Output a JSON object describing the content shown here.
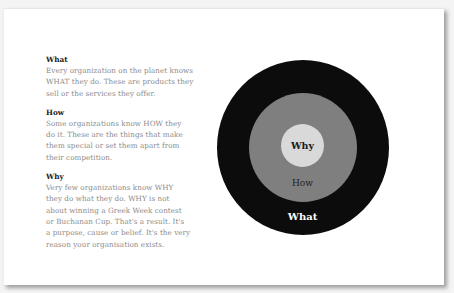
{
  "sections": [
    {
      "heading": "What",
      "lines": [
        "Every organization on the planet knows",
        "WHAT they do. These are products they",
        "sell or the services they offer."
      ]
    },
    {
      "heading": "How",
      "lines": [
        "Some organizations know HOW they",
        "do it. These are the things that make",
        "them special or set them apart from",
        "their competition."
      ]
    },
    {
      "heading": "Why",
      "lines": [
        "Very few organizations know WHY",
        "they do what they do. WHY is not",
        "about winning a Greek Week contest",
        "or Buchanan Cup. That's a result. It's",
        "a purpose, cause or belief. It's the very",
        "reason your organisation exists."
      ]
    }
  ],
  "circle": {
    "inner_label": "Why",
    "middle_label": "How",
    "outer_label": "What",
    "colors": {
      "outer": "#0c0c0c",
      "middle": "#7f7f7f",
      "inner": "#d9d9d9"
    }
  }
}
